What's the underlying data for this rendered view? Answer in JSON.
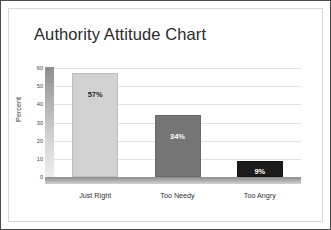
{
  "slide": {
    "title": "Authority Attitude Chart"
  },
  "chart_data": {
    "type": "bar",
    "title": "Authority Attitude Chart",
    "xlabel": "",
    "ylabel": "Percent",
    "categories": [
      "Just Right",
      "Too Needy",
      "Too Angry"
    ],
    "values": [
      57,
      34,
      9
    ],
    "data_labels": [
      "57%",
      "34%",
      "9%"
    ],
    "ylim": [
      0,
      60
    ],
    "yticks": [
      0,
      10,
      20,
      30,
      40,
      50,
      60
    ],
    "ytick_labels": [
      "0",
      "10",
      "20",
      "30",
      "40",
      "50",
      "60"
    ],
    "grid": true,
    "legend": false,
    "series_colors": [
      "#d2d2d2",
      "#757575",
      "#1b1b1b"
    ],
    "label_colors": [
      "#1d1d1d",
      "#ffffff",
      "#ffffff"
    ]
  }
}
